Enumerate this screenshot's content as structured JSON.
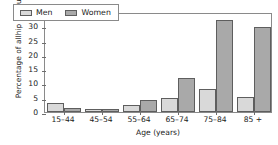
{
  "chart_data": {
    "type": "bar",
    "title": "",
    "xlabel": "Age (years)",
    "ylabel": "Percentage of all hip fractures",
    "ylabel_line1": "Percentage of all",
    "ylabel_line2": "hip fractures",
    "categories": [
      "15–44",
      "45–54",
      "55–64",
      "65–74",
      "75–84",
      "85 +"
    ],
    "series": [
      {
        "name": "Men",
        "color": "#d9d9d9",
        "values": [
          3.0,
          1.1,
          2.3,
          5.0,
          8.2,
          5.4
        ]
      },
      {
        "name": "Women",
        "color": "#a9a9a9",
        "values": [
          1.3,
          1.1,
          4.3,
          12.0,
          32.1,
          29.7
        ]
      }
    ],
    "ylim": [
      0,
      35
    ],
    "yticks": [
      0,
      5,
      10,
      15,
      20,
      25,
      30,
      35
    ],
    "ytick_labels": [
      "0",
      "5",
      "10",
      "15",
      "20",
      "25",
      "30",
      "35"
    ],
    "grid": false,
    "legend_position": "top-left",
    "legend": [
      {
        "label": "Men",
        "swatch": "#d9d9d9"
      },
      {
        "label": "Women",
        "swatch": "#a9a9a9"
      }
    ]
  },
  "colors": {
    "axis": "#8a8a8a",
    "tick": "#6d6d6d",
    "bar_edge": "#5e5e5e",
    "men": "#d9d9d9",
    "women": "#a9a9a9",
    "background": "#ffffff",
    "text": "#1a1a1a"
  }
}
